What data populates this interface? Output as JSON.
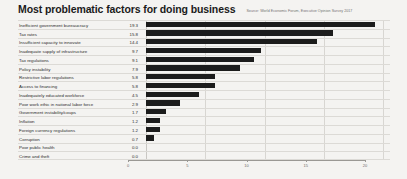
{
  "header": {
    "title": "Most problematic factors for doing business",
    "source": "Source: World Economic Forum, Executive Opinion Survey 2017"
  },
  "chart_data": {
    "type": "bar",
    "orientation": "horizontal",
    "title": "Most problematic factors for doing business",
    "subtitle": "Source: World Economic Forum, Executive Opinion Survey 2017",
    "xlabel": "",
    "ylabel": "",
    "xlim": [
      0,
      20
    ],
    "xticks": [
      0,
      5,
      10,
      15,
      20
    ],
    "xtick_labels": [
      "0",
      "5",
      "10",
      "15",
      "20"
    ],
    "grid": true,
    "legend": false,
    "value_labels_shown": true,
    "bar_color": "#1c1c1c",
    "categories": [
      "Inefficient government bureaucracy",
      "Tax rates",
      "Insufficient capacity to innovate",
      "Inadequate supply of infrastructure",
      "Tax regulations",
      "Policy instability",
      "Restrictive labor regulations",
      "Access to financing",
      "Inadequately educated workforce",
      "Poor work ethic in national labor force",
      "Government instability/coups",
      "Inflation",
      "Foreign currency regulations",
      "Corruption",
      "Poor public health",
      "Crime and theft"
    ],
    "values": [
      19.3,
      15.8,
      14.4,
      9.7,
      9.1,
      7.9,
      5.8,
      5.8,
      4.5,
      2.9,
      1.7,
      1.2,
      1.2,
      0.7,
      0.0,
      0.0
    ],
    "value_labels": [
      "19.3",
      "15.8",
      "14.4",
      "9.7",
      "9.1",
      "7.9",
      "5.8",
      "5.8",
      "4.5",
      "2.9",
      "1.7",
      "1.2",
      "1.2",
      "0.7",
      "0.0",
      "0.0"
    ]
  }
}
